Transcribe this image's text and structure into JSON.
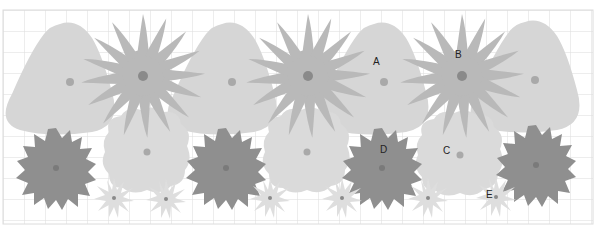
{
  "colors": {
    "grid": "#dcdcdc",
    "blob": "#d6d6d6",
    "burst": "#b9b9b9",
    "gear": "#8f8f8f",
    "cloud": "#dadada",
    "small_star": "#dedede",
    "dot_light": "#a9a9a9",
    "dot_dark": "#8a8a8a",
    "dot_gear": "#7a7a7a"
  },
  "labels": {
    "A": "A",
    "B": "B",
    "C": "C",
    "D": "D",
    "E": "E"
  }
}
